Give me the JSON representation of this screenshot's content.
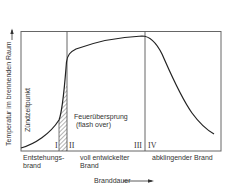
{
  "diagram": {
    "y_axis_label": "Temperatur im brennenden Raum",
    "x_axis_label": "Branddauer",
    "ignition_label": "Zündzeitpunkt",
    "flashover_label_line1": "Feuerübersprung",
    "flashover_label_line2": "(flash over)",
    "phases": [
      {
        "numeral": "I",
        "label_line1": "Entstehungs-",
        "label_line2": "brand"
      },
      {
        "numeral": "II",
        "label_line1": "voll entwickelter",
        "label_line2": "Brand"
      },
      {
        "numeral": "III",
        "label_line1": "",
        "label_line2": ""
      },
      {
        "numeral": "IV",
        "label_line1": "abklingender Brand",
        "label_line2": ""
      }
    ],
    "colors": {
      "line": "#2a2a2a",
      "frame": "#555555",
      "background": "#ffffff"
    }
  }
}
